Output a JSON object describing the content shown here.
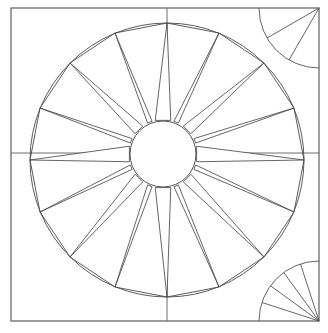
{
  "document": {
    "title": "Compass Rose Line Drawing",
    "canvas_width": 328,
    "canvas_height": 333,
    "background_color": "#ffffff",
    "line_color": "#4a4a4a",
    "frame_color": "#6b6b6b",
    "style": "black-and-white line art / outline drawing"
  },
  "frame": {
    "name": "outer-square-border",
    "left": 11,
    "top": 8,
    "right": 319,
    "bottom": 321,
    "width": 308,
    "height": 313,
    "stroke_color": "#6b6b6b",
    "stroke_width": 1.3
  },
  "guides": {
    "horizontal_center_y": 153,
    "vertical_center_x": 167,
    "stroke_color": "#6f6f6f",
    "description": "crosshair axis lines spanning the full square frame"
  },
  "outer_circle": {
    "name": "compass-outer-circle",
    "center_x": 167,
    "center_y": 160,
    "radius": 137,
    "left_edge_x": 30,
    "right_edge_x": 304,
    "top_edge_y": 23,
    "bottom_edge_y": 297
  },
  "hub_circle": {
    "name": "compass-center-hub",
    "center_x": 163,
    "center_y": 154,
    "radius": 33
  },
  "chart_data": {
    "type": "scatter",
    "xlabel": "",
    "ylabel": "",
    "grid": false,
    "legend": "none",
    "xlim": [
      0,
      328
    ],
    "ylim": [
      0,
      333
    ],
    "categories": [
      "N",
      "NNE",
      "NE",
      "ENE",
      "E",
      "ESE",
      "SE",
      "SSE",
      "S",
      "SSW",
      "SW",
      "WSW",
      "W",
      "WNW",
      "NW",
      "NNW"
    ],
    "values": [
      137,
      137,
      137,
      137,
      137,
      137,
      137,
      137,
      137,
      137,
      137,
      137,
      137,
      137,
      137,
      137
    ],
    "annotations": [
      "4 cardinal points drawn as long wide spears",
      "4 intercardinal points drawn as medium spears",
      "8 secondary points drawn as narrow slivers"
    ]
  },
  "star": {
    "name": "sixteen-point-compass-star",
    "point_count": 16,
    "angle_step_degrees": 22.5,
    "points": [
      {
        "label": "N",
        "angle_deg": -90,
        "tip_x": 167,
        "tip_y": 23,
        "class": "cardinal",
        "half_width_deg": 13
      },
      {
        "label": "NNE",
        "angle_deg": -67.5,
        "tip_x": 219,
        "tip_y": 33,
        "class": "secondary",
        "half_width_deg": 4
      },
      {
        "label": "NE",
        "angle_deg": -45,
        "tip_x": 264,
        "tip_y": 63,
        "class": "intercardinal",
        "half_width_deg": 9
      },
      {
        "label": "ENE",
        "angle_deg": -22.5,
        "tip_x": 294,
        "tip_y": 108,
        "class": "secondary",
        "half_width_deg": 4
      },
      {
        "label": "E",
        "angle_deg": 0,
        "tip_x": 304,
        "tip_y": 160,
        "class": "cardinal",
        "half_width_deg": 13
      },
      {
        "label": "ESE",
        "angle_deg": 22.5,
        "tip_x": 294,
        "tip_y": 212,
        "class": "secondary",
        "half_width_deg": 4
      },
      {
        "label": "SE",
        "angle_deg": 45,
        "tip_x": 264,
        "tip_y": 257,
        "class": "intercardinal",
        "half_width_deg": 9
      },
      {
        "label": "SSE",
        "angle_deg": 67.5,
        "tip_x": 219,
        "tip_y": 287,
        "class": "secondary",
        "half_width_deg": 4
      },
      {
        "label": "S",
        "angle_deg": 90,
        "tip_x": 167,
        "tip_y": 297,
        "class": "cardinal",
        "half_width_deg": 13
      },
      {
        "label": "SSW",
        "angle_deg": 112.5,
        "tip_x": 115,
        "tip_y": 287,
        "class": "secondary",
        "half_width_deg": 4
      },
      {
        "label": "SW",
        "angle_deg": 135,
        "tip_x": 70,
        "tip_y": 257,
        "class": "intercardinal",
        "half_width_deg": 9
      },
      {
        "label": "WSW",
        "angle_deg": 157.5,
        "tip_x": 40,
        "tip_y": 212,
        "class": "secondary",
        "half_width_deg": 4
      },
      {
        "label": "W",
        "angle_deg": 180,
        "tip_x": 30,
        "tip_y": 160,
        "class": "cardinal",
        "half_width_deg": 13
      },
      {
        "label": "WNW",
        "angle_deg": 202.5,
        "tip_x": 40,
        "tip_y": 108,
        "class": "secondary",
        "half_width_deg": 4
      },
      {
        "label": "NW",
        "angle_deg": 225,
        "tip_x": 70,
        "tip_y": 63,
        "class": "intercardinal",
        "half_width_deg": 9
      },
      {
        "label": "NNW",
        "angle_deg": 247.5,
        "tip_x": 115,
        "tip_y": 33,
        "class": "secondary",
        "half_width_deg": 4
      }
    ]
  },
  "corner_fans": [
    {
      "name": "top-right-corner-fan",
      "position": "top-right",
      "pivot_x": 319,
      "pivot_y": 8,
      "radius": 60,
      "ray_count": 2,
      "arc_span_degrees": 90
    },
    {
      "name": "bottom-right-corner-fan",
      "position": "bottom-right",
      "pivot_x": 319,
      "pivot_y": 321,
      "radius": 60,
      "ray_count": 4,
      "arc_span_degrees": 90
    }
  ],
  "corners_plain": [
    {
      "name": "top-left-corner",
      "position": "top-left"
    },
    {
      "name": "bottom-left-corner",
      "position": "bottom-left"
    }
  ]
}
